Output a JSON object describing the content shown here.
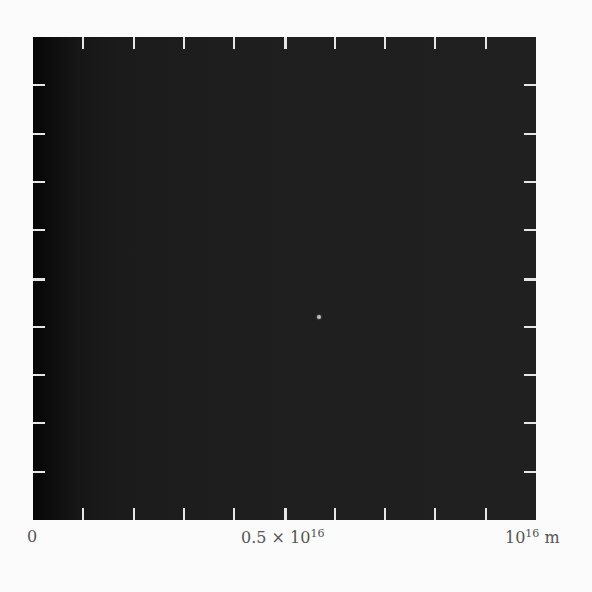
{
  "chart_data": {
    "type": "heatmap",
    "title": "",
    "xlabel": "m",
    "ylabel": "",
    "xlim": [
      0,
      1e+16
    ],
    "x_tick_labels": [
      "0",
      "0.5 × 10^16",
      "10^16 m"
    ],
    "x_tick_values": [
      0,
      5000000000000000.0,
      1e+16
    ],
    "minor_ticks_per_side": 9,
    "point_source": {
      "x": 5000000000000000.0,
      "y": 5000000000000000.0,
      "label": ""
    },
    "grid": false,
    "legend": null
  },
  "axis": {
    "label_zero": "0",
    "label_mid_base": "0.5 × 10",
    "label_mid_exp": "16",
    "label_end_base": "10",
    "label_end_exp": "16",
    "label_end_unit": " m"
  },
  "colors": {
    "background": "#fbfbfb",
    "field": "#1e1e1e",
    "ticks": "#e6e6e6",
    "text": "#555555"
  }
}
